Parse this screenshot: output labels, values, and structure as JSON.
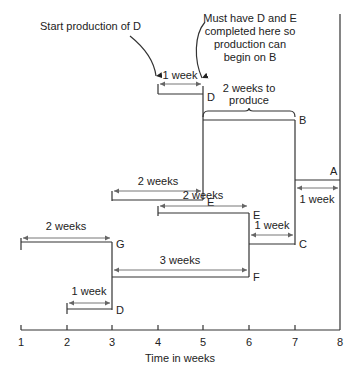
{
  "diagram": {
    "x_axis": {
      "label": "Time in weeks",
      "ticks": [
        "1",
        "2",
        "3",
        "4",
        "5",
        "6",
        "7",
        "8"
      ]
    },
    "callouts": {
      "start_d": "Start production of D",
      "must_have": [
        "Must have D and E",
        "completed here so",
        "production can",
        "begin on B"
      ]
    },
    "items": {
      "A": {
        "label": "A",
        "duration": "1 week",
        "start": 7,
        "end": 8
      },
      "B": {
        "label": "B",
        "duration": [
          "2 weeks to",
          "produce"
        ],
        "start": 5,
        "end": 7
      },
      "C": {
        "label": "C",
        "duration": "1 week",
        "start": 6,
        "end": 7
      },
      "D_top": {
        "label": "D",
        "duration": "1 week",
        "start": 4,
        "end": 5
      },
      "E_top": {
        "label": "E",
        "duration": "2 weeks",
        "start": 3,
        "end": 5
      },
      "E_mid": {
        "label": "E",
        "duration": "2 weeks",
        "start": 4,
        "end": 6
      },
      "F": {
        "label": "F",
        "duration": "3 weeks",
        "start": 3,
        "end": 6
      },
      "G": {
        "label": "G",
        "duration": "2 weeks",
        "start": 1,
        "end": 3
      },
      "D_bottom": {
        "label": "D",
        "duration": "1 week",
        "start": 2,
        "end": 3
      }
    }
  }
}
